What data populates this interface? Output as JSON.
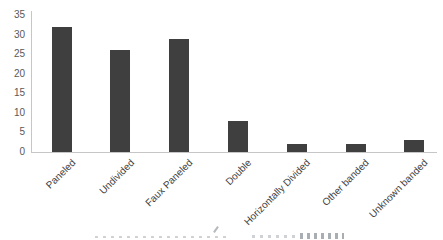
{
  "chart_data": {
    "type": "bar",
    "title": "",
    "xlabel": "",
    "ylabel": "",
    "categories": [
      "Paneled",
      "Undivided",
      "Faux Paneled",
      "Double",
      "Horizontally Divided",
      "Other banded",
      "Unknown banded"
    ],
    "values": [
      32,
      26,
      29,
      8,
      2,
      2,
      3
    ],
    "ylim": [
      0,
      35
    ],
    "yticks": [
      0,
      5,
      10,
      15,
      20,
      25,
      30,
      35
    ],
    "grid": false,
    "legend": "none",
    "bar_color": "#3f3f3f",
    "axis_color": "#c6c6c6",
    "y_tick_label_color": "#595959",
    "category_label_color": "#3f3f3f",
    "background_color": "#ffffff"
  }
}
